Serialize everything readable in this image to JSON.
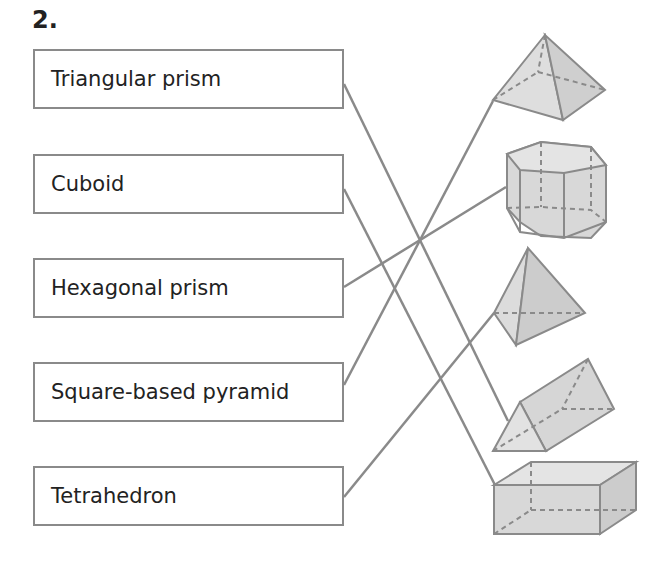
{
  "question": {
    "number": "2."
  },
  "labels": [
    {
      "text": "Triangular prism",
      "matches_shape": 3
    },
    {
      "text": "Cuboid",
      "matches_shape": 4
    },
    {
      "text": "Hexagonal prism",
      "matches_shape": 1
    },
    {
      "text": "Square-based pyramid",
      "matches_shape": 0
    },
    {
      "text": "Tetrahedron",
      "matches_shape": 2
    }
  ],
  "shapes": [
    {
      "name": "square-based-pyramid"
    },
    {
      "name": "hexagonal-prism"
    },
    {
      "name": "tetrahedron"
    },
    {
      "name": "triangular-prism"
    },
    {
      "name": "cuboid"
    }
  ],
  "colors": {
    "line": "#8a8a8a",
    "shape_fill": "#dcdcdc",
    "shape_dark": "#c8c8c8",
    "text": "#222222"
  }
}
